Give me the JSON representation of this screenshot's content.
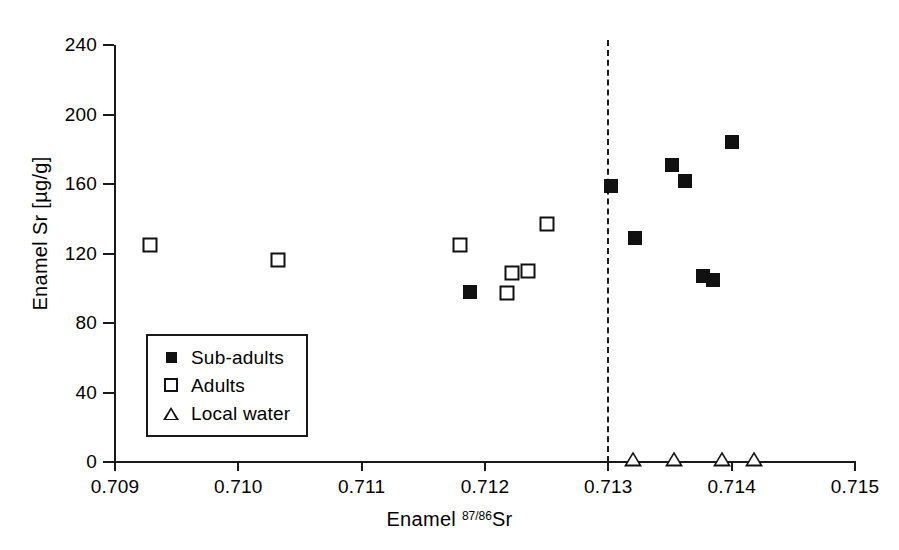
{
  "chart_data": {
    "type": "scatter",
    "title": "",
    "xlabel": "Enamel 87/86Sr",
    "xlabel_parts": {
      "prefix": "Enamel ",
      "superscript": "87/86",
      "suffix": "Sr"
    },
    "ylabel": "Enamel Sr [µg/g]",
    "xlim": [
      0.709,
      0.715
    ],
    "ylim": [
      0,
      240
    ],
    "xticks": [
      "0.709",
      "0.710",
      "0.711",
      "0.712",
      "0.713",
      "0.714",
      "0.715"
    ],
    "xtick_values": [
      0.709,
      0.71,
      0.711,
      0.712,
      0.713,
      0.714,
      0.715
    ],
    "yticks": [
      "0",
      "40",
      "80",
      "120",
      "160",
      "200",
      "240"
    ],
    "ytick_values": [
      0,
      40,
      80,
      120,
      160,
      200,
      240
    ],
    "grid": false,
    "legend_position": "lower-left-inside",
    "annotations": [
      {
        "name": "local-water-threshold",
        "type": "vline",
        "x": 0.713,
        "style": "dashed",
        "label": ""
      }
    ],
    "series": [
      {
        "name": "Sub-adults",
        "marker": "filled-square",
        "color": "#111111",
        "points": [
          {
            "x": 0.71188,
            "y": 98
          },
          {
            "x": 0.71302,
            "y": 159
          },
          {
            "x": 0.71322,
            "y": 129
          },
          {
            "x": 0.71352,
            "y": 171
          },
          {
            "x": 0.71362,
            "y": 162
          },
          {
            "x": 0.71377,
            "y": 107
          },
          {
            "x": 0.71385,
            "y": 105
          },
          {
            "x": 0.714,
            "y": 184
          }
        ]
      },
      {
        "name": "Adults",
        "marker": "open-square",
        "color": "#111111",
        "points": [
          {
            "x": 0.70928,
            "y": 125
          },
          {
            "x": 0.71032,
            "y": 116
          },
          {
            "x": 0.7118,
            "y": 125
          },
          {
            "x": 0.71218,
            "y": 97
          },
          {
            "x": 0.71222,
            "y": 109
          },
          {
            "x": 0.71235,
            "y": 110
          },
          {
            "x": 0.7125,
            "y": 137
          }
        ]
      },
      {
        "name": "Local water",
        "marker": "open-triangle",
        "color": "#111111",
        "points": [
          {
            "x": 0.7132,
            "y": 0
          },
          {
            "x": 0.71353,
            "y": 0
          },
          {
            "x": 0.71392,
            "y": 0
          },
          {
            "x": 0.71418,
            "y": 0
          }
        ]
      }
    ]
  },
  "legend": {
    "items": [
      {
        "label": "Sub-adults",
        "marker": "filled-square"
      },
      {
        "label": "Adults",
        "marker": "open-square"
      },
      {
        "label": "Local water",
        "marker": "open-triangle"
      }
    ]
  },
  "colors": {
    "ink": "#111111",
    "axis": "#1a1a1a",
    "background": "#ffffff"
  }
}
